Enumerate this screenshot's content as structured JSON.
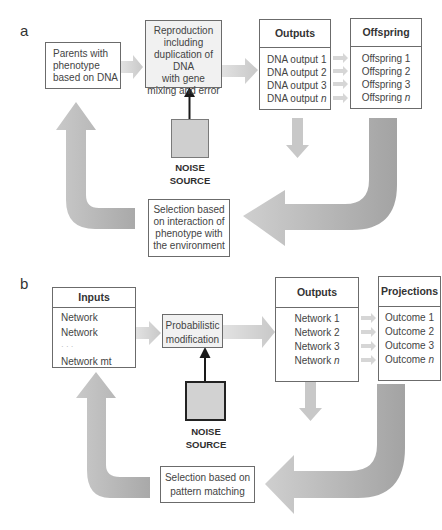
{
  "panel_a": {
    "label": "a",
    "parents_box": {
      "lines": [
        "Parents with",
        "phenotype",
        "based on DNA"
      ]
    },
    "reproduction_box": {
      "lines": [
        "Reproduction",
        "including",
        "duplication of DNA",
        "with gene",
        "mixing and error"
      ]
    },
    "outputs_table": {
      "header": "Outputs",
      "rows": [
        {
          "text": "DNA output 1",
          "suffix": ""
        },
        {
          "text": "DNA output 2",
          "suffix": ""
        },
        {
          "text": "DNA output 3",
          "suffix": ""
        },
        {
          "text": "DNA output ",
          "suffix": "n"
        }
      ]
    },
    "offspring_table": {
      "header": "Offspring",
      "rows": [
        {
          "text": "Offspring 1",
          "suffix": ""
        },
        {
          "text": "Offspring 2",
          "suffix": ""
        },
        {
          "text": "Offspring 3",
          "suffix": ""
        },
        {
          "text": "Offspring ",
          "suffix": "n"
        }
      ]
    },
    "noise_source": {
      "line1": "NOISE",
      "line2": "SOURCE"
    },
    "selection_box": {
      "lines": [
        "Selection based",
        "on interaction of",
        "phenotype with",
        "the environment"
      ]
    }
  },
  "panel_b": {
    "label": "b",
    "inputs_table": {
      "header": "Inputs",
      "rows": [
        {
          "text": "Network",
          "suffix": ""
        },
        {
          "text": "Network",
          "suffix": ""
        },
        {
          "text": "· · ·",
          "suffix": ""
        },
        {
          "text": "Network mt",
          "suffix": ""
        }
      ]
    },
    "probabilistic_box": {
      "lines": [
        "Probabilistic",
        "modification"
      ]
    },
    "outputs_table": {
      "header": "Outputs",
      "rows": [
        {
          "text": "Network 1",
          "suffix": ""
        },
        {
          "text": "Network 2",
          "suffix": ""
        },
        {
          "text": "Network 3",
          "suffix": ""
        },
        {
          "text": "Network ",
          "suffix": "n"
        }
      ]
    },
    "projections_table": {
      "header": "Projections",
      "rows": [
        {
          "text": "Outcome 1",
          "suffix": ""
        },
        {
          "text": "Outcome 2",
          "suffix": ""
        },
        {
          "text": "Outcome 3",
          "suffix": ""
        },
        {
          "text": "Outcome ",
          "suffix": "n"
        }
      ]
    },
    "noise_source": {
      "line1": "NOISE",
      "line2": "SOURCE"
    },
    "selection_box": {
      "lines": [
        "Selection based on",
        "pattern matching"
      ]
    }
  },
  "colors": {
    "arrow_light": "#d3d3d3",
    "arrow_mid": "#bdbdbd",
    "arrow_dark": "#9e9e9e",
    "noise_fill": "#cfcfcf",
    "box_border": "#6b6b6b",
    "shaded_box": "#f1f1f1"
  }
}
